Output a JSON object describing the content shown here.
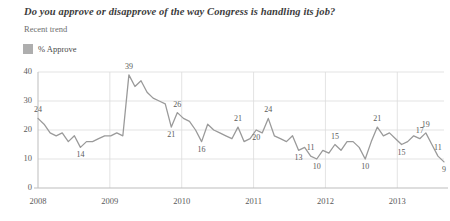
{
  "header": {
    "title": "Do you approve or disapprove of the way Congress is handling its job?",
    "subtitle": "Recent trend"
  },
  "legend": {
    "swatch_color": "#aeaeae",
    "label": "% Approve"
  },
  "chart_data": {
    "type": "line",
    "title": "Do you approve or disapprove of the way Congress is handling its job?",
    "subtitle": "Recent trend",
    "xlabel": "",
    "ylabel": "",
    "ylim": [
      0,
      40
    ],
    "yticks": [
      "0",
      "10",
      "20",
      "30",
      "40"
    ],
    "xticks": [
      "2008",
      "2009",
      "2010",
      "2011",
      "2012",
      "2013"
    ],
    "grid": true,
    "legend_position": "top-left",
    "line_color": "#9a9a9a",
    "series": [
      {
        "name": "% Approve",
        "values": [
          24,
          22,
          19,
          18,
          19,
          16,
          18,
          14,
          16,
          16,
          17,
          18,
          18,
          19,
          18,
          39,
          35,
          37,
          33,
          31,
          30,
          29,
          21,
          26,
          24,
          23,
          20,
          16,
          22,
          20,
          19,
          18,
          17,
          21,
          16,
          17,
          20,
          19,
          24,
          18,
          17,
          16,
          18,
          13,
          14,
          11,
          10,
          13,
          12,
          15,
          13,
          16,
          16,
          14,
          10,
          16,
          21,
          18,
          19,
          17,
          15,
          16,
          18,
          17,
          19,
          15,
          11,
          9
        ]
      }
    ],
    "point_labels": [
      {
        "index": 0,
        "text": "24",
        "position": "above"
      },
      {
        "index": 7,
        "text": "14",
        "position": "below"
      },
      {
        "index": 15,
        "text": "39",
        "position": "above"
      },
      {
        "index": 23,
        "text": "26",
        "position": "above"
      },
      {
        "index": 22,
        "text": "21",
        "position": "below"
      },
      {
        "index": 27,
        "text": "16",
        "position": "below"
      },
      {
        "index": 33,
        "text": "21",
        "position": "above"
      },
      {
        "index": 36,
        "text": "20",
        "position": "below"
      },
      {
        "index": 38,
        "text": "24",
        "position": "above"
      },
      {
        "index": 43,
        "text": "13",
        "position": "below"
      },
      {
        "index": 45,
        "text": "11",
        "position": "above"
      },
      {
        "index": 46,
        "text": "10",
        "position": "below"
      },
      {
        "index": 49,
        "text": "15",
        "position": "above"
      },
      {
        "index": 54,
        "text": "10",
        "position": "below"
      },
      {
        "index": 56,
        "text": "21",
        "position": "above"
      },
      {
        "index": 60,
        "text": "15",
        "position": "below"
      },
      {
        "index": 63,
        "text": "17",
        "position": "above"
      },
      {
        "index": 64,
        "text": "19",
        "position": "above"
      },
      {
        "index": 66,
        "text": "11",
        "position": "above"
      },
      {
        "index": 67,
        "text": "9",
        "position": "below"
      }
    ]
  }
}
